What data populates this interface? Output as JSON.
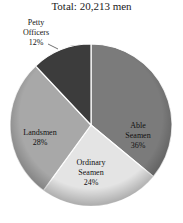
{
  "chart_data": {
    "type": "pie",
    "title": "Total: 20,213 men",
    "total": 20213,
    "unit": "men",
    "start_angle_deg": 0,
    "direction": "clockwise",
    "slices": [
      {
        "label_line1": "Able",
        "label_line2": "Seamen",
        "name": "Able Seamen",
        "value": 36,
        "pct_label": "36%",
        "color": "#7b7b7b"
      },
      {
        "label_line1": "Ordinary",
        "label_line2": "Seamen",
        "name": "Ordinary Seamen",
        "value": 24,
        "pct_label": "24%",
        "color": "#e4e4e4"
      },
      {
        "label_line1": "Landsmen",
        "label_line2": "",
        "name": "Landsmen",
        "value": 28,
        "pct_label": "28%",
        "color": "#a8a8a8"
      },
      {
        "label_line1": "Petty",
        "label_line2": "Officers",
        "name": "Petty Officers",
        "value": 12,
        "pct_label": "12%",
        "color": "#3c3c3c"
      }
    ],
    "legend": "none (direct labels)"
  }
}
